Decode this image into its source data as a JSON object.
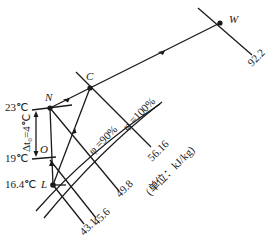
{
  "diagram": {
    "type": "psychrometric-process",
    "points": {
      "W": {
        "label": "W"
      },
      "C": {
        "label": "C"
      },
      "N": {
        "label": "N"
      },
      "O": {
        "label": "O"
      },
      "L": {
        "label": "L"
      }
    },
    "enthalpy_lines": [
      {
        "value": "92.2"
      },
      {
        "value": "56.16"
      },
      {
        "value": "49.8"
      },
      {
        "value": "45.6"
      },
      {
        "value": "43.1"
      }
    ],
    "unit_note": "(单位：kJ/kg)",
    "humidity_curves": [
      {
        "label": "φ =90%"
      },
      {
        "label": "φ =100%"
      }
    ],
    "temperatures": {
      "t_N": "23℃",
      "t_O": "19℃",
      "t_L": "16.4℃"
    },
    "delta_t": "Δt₀=4℃",
    "colors": {
      "line": "#1a1a1a",
      "background": "#ffffff"
    }
  }
}
